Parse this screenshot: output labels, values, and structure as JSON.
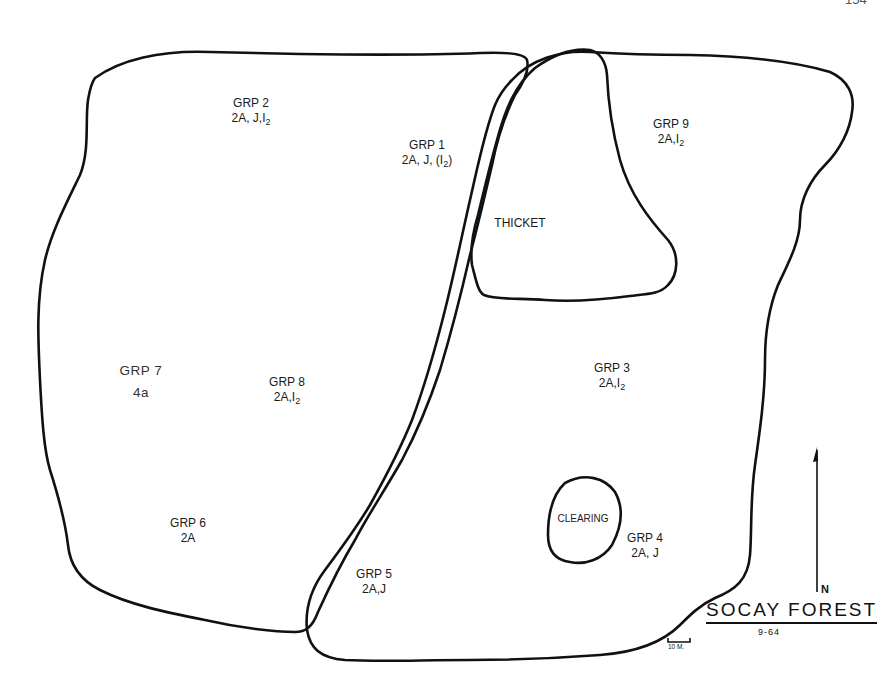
{
  "page_number": "154",
  "map": {
    "title": "SOCAY FOREST",
    "date": "9-64",
    "north_label": "N",
    "scale_label": "10 M.",
    "colors": {
      "ink": "#111111",
      "paper": "#ffffff"
    }
  },
  "features": {
    "thicket": "THICKET",
    "clearing": "CLEARING"
  },
  "groups": [
    {
      "name": "GRP 2",
      "code": "2A, J,",
      "code_sub_main": "I",
      "code_sub": "2",
      "code_tail": ""
    },
    {
      "name": "GRP 1",
      "code": "2A, J, (",
      "code_sub_main": "I",
      "code_sub": "2",
      "code_tail": ")"
    },
    {
      "name": "GRP 9",
      "code": "2A,",
      "code_sub_main": "I",
      "code_sub": "2",
      "code_tail": ""
    },
    {
      "name": "GRP 7",
      "code": "4a"
    },
    {
      "name": "GRP 8",
      "code": "2A,",
      "code_sub_main": "I",
      "code_sub": "2",
      "code_tail": ""
    },
    {
      "name": "GRP 3",
      "code": "2A,",
      "code_sub_main": "I",
      "code_sub": "2",
      "code_tail": ""
    },
    {
      "name": "GRP 6",
      "code": "2A"
    },
    {
      "name": "GRP 4",
      "code": "2A, J"
    },
    {
      "name": "GRP 5",
      "code": "2A,J"
    }
  ]
}
